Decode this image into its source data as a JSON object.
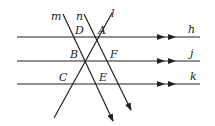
{
  "diagram": {
    "type": "geometry-parallel-lines",
    "stroke_color": "#222222",
    "horizontal_lines": [
      {
        "name": "h",
        "label": "h",
        "y": 37
      },
      {
        "name": "j",
        "label": "j",
        "y": 61
      },
      {
        "name": "k",
        "label": "k",
        "y": 84
      }
    ],
    "transversals": [
      {
        "name": "m",
        "label": "m"
      },
      {
        "name": "n",
        "label": "n"
      },
      {
        "name": "l",
        "label": "l"
      }
    ],
    "points": [
      {
        "label": "A"
      },
      {
        "label": "B"
      },
      {
        "label": "C"
      },
      {
        "label": "D"
      },
      {
        "label": "E"
      },
      {
        "label": "F"
      }
    ]
  }
}
